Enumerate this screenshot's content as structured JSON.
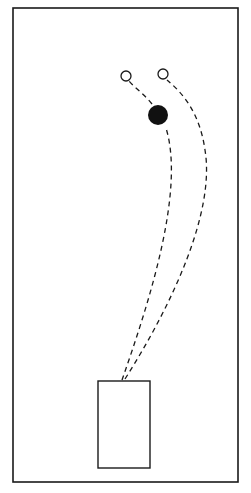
{
  "diagram": {
    "colors": {
      "stroke": "#1a1a1a",
      "fill": "#111111",
      "background": "#ffffff"
    },
    "field": {
      "x": 13,
      "y": 8,
      "w": 225,
      "h": 474
    },
    "start_box": {
      "x": 98,
      "y": 381,
      "w": 52,
      "h": 87
    },
    "open_markers": [
      {
        "cx": 126,
        "cy": 76,
        "r": 5
      },
      {
        "cx": 163,
        "cy": 74,
        "r": 5
      }
    ],
    "filled_marker": {
      "cx": 158,
      "cy": 115,
      "r": 10
    },
    "paths": [
      {
        "d": "M 122 380 C 150 300, 185 190, 166 128 M 152 104 C 145 95, 135 88, 129 81"
      },
      {
        "d": "M 125 379 C 175 300, 215 210, 205 150 C 200 115, 185 95, 167 80"
      }
    ]
  }
}
